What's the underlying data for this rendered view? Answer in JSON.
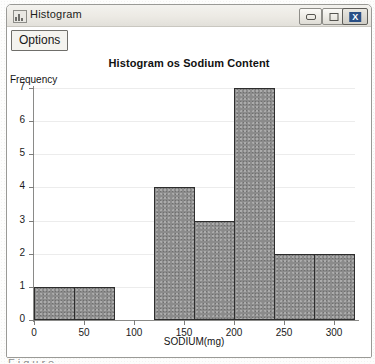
{
  "window": {
    "title": "Histogram",
    "icon": "histogram-app-icon",
    "controls": {
      "minimize": "–",
      "maximize": "□",
      "close": "X"
    }
  },
  "toolbar": {
    "options_label": "Options"
  },
  "chart_data": {
    "type": "bar",
    "title": "Histogram os Sodium Content",
    "xlabel": "SODIUM(mg)",
    "ylabel": "Frequency",
    "xlim": [
      0,
      320
    ],
    "ylim": [
      0,
      7
    ],
    "grid": true,
    "legend": "none",
    "bin_width": 40,
    "x_ticks": [
      0,
      50,
      100,
      150,
      200,
      250,
      300
    ],
    "x_tick_labels": [
      "0",
      "50",
      "100",
      "150",
      "200",
      "250",
      "300"
    ],
    "y_ticks": [
      0,
      1,
      2,
      3,
      4,
      5,
      6,
      7
    ],
    "y_tick_labels": [
      "0",
      "1",
      "2",
      "3",
      "4",
      "5",
      "6",
      "7"
    ],
    "bins": [
      {
        "start": 0,
        "end": 40,
        "value": 1
      },
      {
        "start": 40,
        "end": 80,
        "value": 1
      },
      {
        "start": 120,
        "end": 160,
        "value": 4
      },
      {
        "start": 160,
        "end": 200,
        "value": 3
      },
      {
        "start": 200,
        "end": 240,
        "value": 7
      },
      {
        "start": 240,
        "end": 280,
        "value": 2
      },
      {
        "start": 280,
        "end": 320,
        "value": 2
      }
    ],
    "colors": {
      "bar_fill": "#8b8b8b",
      "bar_border": "#2d2d2d",
      "axis": "#8a8a88",
      "text": "#1a1a1a"
    }
  },
  "artifact": {
    "bottom_text": "Figure 2-7 b"
  }
}
